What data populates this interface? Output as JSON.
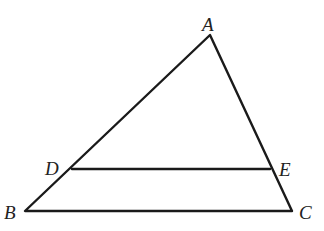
{
  "diagram": {
    "type": "triangle-with-parallel-segment",
    "points": {
      "A": {
        "label": "A",
        "x": 210,
        "y": 35
      },
      "B": {
        "label": "B",
        "x": 25,
        "y": 211
      },
      "C": {
        "label": "C",
        "x": 292,
        "y": 211
      },
      "D": {
        "label": "D",
        "x": 72,
        "y": 169
      },
      "E": {
        "label": "E",
        "x": 270,
        "y": 169
      }
    },
    "segments": [
      "AB",
      "AC",
      "BC",
      "DE"
    ],
    "labels": {
      "A": "A",
      "B": "B",
      "C": "C",
      "D": "D",
      "E": "E"
    }
  }
}
